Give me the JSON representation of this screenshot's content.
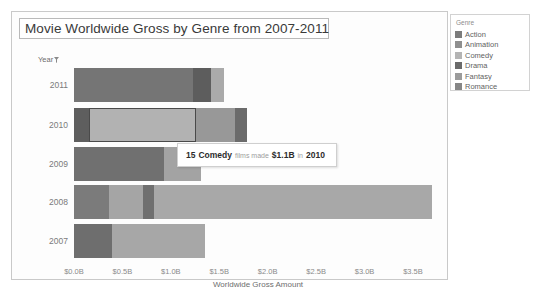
{
  "panel": {
    "title": "Movie Worldwide Gross by Genre from 2007-2011"
  },
  "axes": {
    "y_header": "Year",
    "y_filter_icon": "funnel-icon",
    "x_title": "Worldwide Gross Amount",
    "x_ticks": [
      "$0.0B",
      "$0.5B",
      "$1.0B",
      "$1.5B",
      "$2.0B",
      "$2.5B",
      "$3.0B",
      "$3.5B"
    ]
  },
  "legend": {
    "title": "Genre",
    "items": [
      {
        "label": "Action",
        "color": "#7c7c7c"
      },
      {
        "label": "Animation",
        "color": "#8f8f8f"
      },
      {
        "label": "Comedy",
        "color": "#b4b4b4"
      },
      {
        "label": "Drama",
        "color": "#6a6a6a"
      },
      {
        "label": "Fantasy",
        "color": "#9b9b9b"
      },
      {
        "label": "Romance",
        "color": "#868686"
      }
    ]
  },
  "tooltip": {
    "count": "15",
    "genre": "Comedy",
    "mid_text": "films made",
    "amount": "$1.1B",
    "in_text": "in",
    "year": "2010"
  },
  "chart_data": {
    "type": "bar",
    "orientation": "horizontal",
    "stacked": true,
    "title": "Movie Worldwide Gross by Genre from 2007-2011",
    "xlabel": "Worldwide Gross Amount",
    "ylabel": "Year",
    "xlim": [
      0,
      3.8
    ],
    "xtick_values": [
      0,
      0.5,
      1.0,
      1.5,
      2.0,
      2.5,
      3.0,
      3.5
    ],
    "grid": false,
    "legend_position": "right",
    "categories": [
      "2011",
      "2010",
      "2009",
      "2008",
      "2007"
    ],
    "series": [
      {
        "name": "Action",
        "color": "#7c7c7c",
        "values": [
          0.0,
          0.14,
          0.0,
          0.34,
          0.0
        ]
      },
      {
        "name": "Animation",
        "color": "#8f8f8f",
        "values": [
          0.0,
          0.0,
          0.0,
          0.33,
          0.0
        ]
      },
      {
        "name": "Comedy",
        "color": "#b4b4b4",
        "values": [
          0.0,
          1.1,
          0.0,
          0.0,
          0.95
        ]
      },
      {
        "name": "Drama",
        "color": "#6a6a6a",
        "values": [
          1.23,
          0.0,
          0.92,
          0.12,
          0.38
        ]
      },
      {
        "name": "Fantasy",
        "color": "#9b9b9b",
        "values": [
          0.18,
          0.36,
          0.39,
          2.9,
          0.0
        ]
      },
      {
        "name": "Romance",
        "color": "#868686",
        "values": [
          0.14,
          0.12,
          0.0,
          0.0,
          0.0
        ]
      }
    ],
    "bars": [
      {
        "year": "2011",
        "total": 1.55,
        "segments": [
          {
            "genre": "Drama",
            "start": 0.0,
            "value": 1.23,
            "color": "#757575",
            "highlighted": false
          },
          {
            "genre": "Fantasy",
            "start": 1.23,
            "value": 0.18,
            "color": "#5d5d5d",
            "highlighted": false
          },
          {
            "genre": "Romance",
            "start": 1.41,
            "value": 0.14,
            "color": "#aaaaaa",
            "highlighted": false
          }
        ]
      },
      {
        "year": "2010",
        "total": 1.79,
        "segments": [
          {
            "genre": "Action",
            "start": 0.0,
            "value": 0.16,
            "color": "#5e5e5e",
            "highlighted": false
          },
          {
            "genre": "Comedy",
            "start": 0.16,
            "value": 1.1,
            "color": "#b2b2b2",
            "highlighted": true
          },
          {
            "genre": "Fantasy",
            "start": 1.26,
            "value": 0.4,
            "color": "#989898",
            "highlighted": false
          },
          {
            "genre": "Romance",
            "start": 1.66,
            "value": 0.13,
            "color": "#6b6b6b",
            "highlighted": false
          }
        ]
      },
      {
        "year": "2009",
        "total": 1.31,
        "segments": [
          {
            "genre": "Drama",
            "start": 0.0,
            "value": 0.93,
            "color": "#707070",
            "highlighted": false
          },
          {
            "genre": "Fantasy",
            "start": 0.93,
            "value": 0.38,
            "color": "#a3a3a3",
            "highlighted": false
          }
        ]
      },
      {
        "year": "2008",
        "total": 3.7,
        "segments": [
          {
            "genre": "Action",
            "start": 0.0,
            "value": 0.36,
            "color": "#7b7b7b",
            "highlighted": false
          },
          {
            "genre": "Animation",
            "start": 0.36,
            "value": 0.35,
            "color": "#a5a5a5",
            "highlighted": false
          },
          {
            "genre": "Drama",
            "start": 0.71,
            "value": 0.12,
            "color": "#6f6f6f",
            "highlighted": false
          },
          {
            "genre": "Fantasy",
            "start": 0.83,
            "value": 2.87,
            "color": "#a8a8a8",
            "highlighted": false
          }
        ]
      },
      {
        "year": "2007",
        "total": 1.35,
        "segments": [
          {
            "genre": "Drama",
            "start": 0.0,
            "value": 0.39,
            "color": "#6e6e6e",
            "highlighted": false
          },
          {
            "genre": "Comedy",
            "start": 0.39,
            "value": 0.96,
            "color": "#a7a7a7",
            "highlighted": false
          }
        ]
      }
    ],
    "annotations": [
      {
        "text": "15 Comedy films made $1.1B in 2010",
        "target_year": "2010",
        "target_genre": "Comedy"
      }
    ]
  }
}
